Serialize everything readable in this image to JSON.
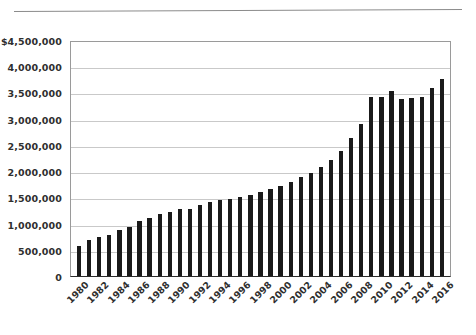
{
  "chart_data": {
    "type": "bar",
    "title": "",
    "subtitle": "",
    "xlabel": "",
    "ylabel": "",
    "ylim": [
      0,
      4500000
    ],
    "grid": true,
    "legend": false,
    "legend_position": "none",
    "y_ticks": [
      "0",
      "500,000",
      "1,000,000",
      "1,500,000",
      "2,000,000",
      "2,500,000",
      "3,000,000",
      "3,500,000",
      "4,000,000",
      "$4,500,000"
    ],
    "y_tick_values": [
      0,
      500000,
      1000000,
      1500000,
      2000000,
      2500000,
      3000000,
      3500000,
      4000000,
      4500000
    ],
    "x_tick_labels": [
      "1980",
      "1982",
      "1984",
      "1986",
      "1988",
      "1990",
      "1992",
      "1994",
      "1996",
      "1998",
      "2000",
      "2002",
      "2004",
      "2006",
      "2008",
      "2010",
      "2012",
      "2014",
      "2016"
    ],
    "categories": [
      "1980",
      "1981",
      "1982",
      "1983",
      "1984",
      "1985",
      "1986",
      "1987",
      "1988",
      "1989",
      "1990",
      "1991",
      "1992",
      "1993",
      "1994",
      "1995",
      "1996",
      "1997",
      "1998",
      "1999",
      "2000",
      "2001",
      "2002",
      "2003",
      "2004",
      "2005",
      "2006",
      "2007",
      "2008",
      "2009",
      "2010",
      "2011",
      "2012",
      "2013",
      "2014",
      "2015",
      "2016"
    ],
    "values": [
      570000,
      680000,
      750000,
      790000,
      880000,
      930000,
      1040000,
      1110000,
      1180000,
      1230000,
      1280000,
      1270000,
      1350000,
      1410000,
      1440000,
      1470000,
      1500000,
      1540000,
      1600000,
      1660000,
      1720000,
      1790000,
      1880000,
      1970000,
      2080000,
      2220000,
      2380000,
      2640000,
      2900000,
      3420000,
      3410000,
      3530000,
      3380000,
      3390000,
      3410000,
      3590000,
      3750000
    ],
    "bar_color": "#1a1a1a",
    "grid_color": "#c9c9c9",
    "axis_color": "#2b2b2b"
  },
  "accents": {
    "text": "#2f2f2f",
    "background": "#ffffff"
  }
}
